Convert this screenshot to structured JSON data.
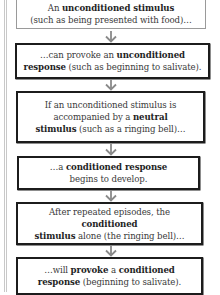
{
  "diagram": {
    "type": "flowchart",
    "direction": "top-to-bottom",
    "steps": [
      {
        "id": 1,
        "line1_pre": "An ",
        "line1_bold": "unconditioned stimulus",
        "line2": "(such as being presented with food)…",
        "border": "gray"
      },
      {
        "id": 2,
        "line1_pre": "…can provoke an ",
        "line1_bold": "unconditioned",
        "line2_bold": "response",
        "line2_post": " (such as beginning to salivate).",
        "border": "black"
      },
      {
        "id": 3,
        "line1": "If an unconditioned stimulus is",
        "line2_pre": "accompanied by a ",
        "line2_bold": "neutral",
        "line3_bold": "stimulus",
        "line3_post": " (such as a ringing bell)…",
        "border": "black"
      },
      {
        "id": 4,
        "line1_pre": "…a ",
        "line1_bold": "conditioned response",
        "line2": "begins to develop.",
        "border": "black"
      },
      {
        "id": 5,
        "line1_pre": "After repeated episodes, the ",
        "line1_bold": "conditioned",
        "line2_bold": "stimulus",
        "line2_post": " alone (the ringing bell)…",
        "border": "black"
      },
      {
        "id": 6,
        "line1_pre": "…will ",
        "line1_bold": "provoke",
        "line1_mid": " a ",
        "line1_bold2": "conditioned",
        "line2_bold": "response",
        "line2_post": " (beginning to salivate).",
        "border": "black"
      }
    ],
    "arrow_icon": "down-arrow",
    "colors": {
      "text": "#3a3a3a",
      "bold_text": "#1e1e1e",
      "first_box_border": "#9a9a9a",
      "box_border": "#1c1c1c",
      "arrow": "#8a8a8a",
      "margin_line": "#c8c8c8"
    }
  }
}
